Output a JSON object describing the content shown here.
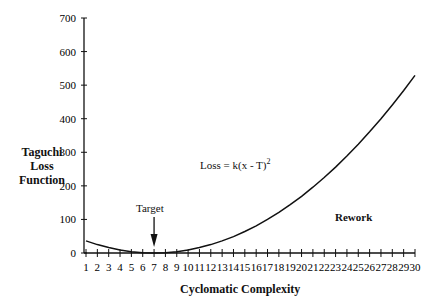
{
  "chart_data": {
    "type": "line",
    "title": "",
    "xlabel": "Cyclomatic Complexity",
    "ylabel": "Taguchi Loss Function",
    "x": [
      1,
      2,
      3,
      4,
      5,
      6,
      7,
      8,
      9,
      10,
      11,
      12,
      13,
      14,
      15,
      16,
      17,
      18,
      19,
      20,
      21,
      22,
      23,
      24,
      25,
      26,
      27,
      28,
      29,
      30
    ],
    "series": [
      {
        "name": "Loss",
        "values": [
          36,
          25,
          16,
          9,
          4,
          1,
          0,
          1,
          4,
          9,
          16,
          25,
          36,
          49,
          64,
          81,
          100,
          121,
          144,
          169,
          196,
          225,
          256,
          289,
          324,
          361,
          400,
          441,
          484,
          529
        ]
      }
    ],
    "yticks": [
      0,
      100,
      200,
      300,
      400,
      500,
      600,
      700
    ],
    "ylim": [
      0,
      700
    ],
    "xlim": [
      1,
      30
    ],
    "grid": false,
    "annotations": [
      {
        "text": "Loss = k(x - T)",
        "superscript": "2"
      },
      {
        "text": "Target",
        "arrow_to_x": 7
      },
      {
        "text": "Rework"
      }
    ]
  },
  "labels": {
    "ylabel_lines": [
      "Taguchi",
      "Loss",
      "Function"
    ],
    "xlabel": "Cyclomatic Complexity",
    "formula_main": "Loss = k(x - T)",
    "formula_sup": "2",
    "target": "Target",
    "rework": "Rework"
  }
}
